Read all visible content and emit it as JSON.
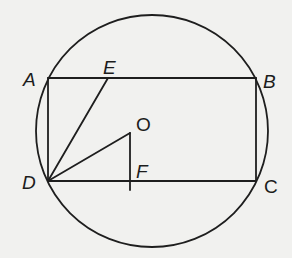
{
  "figure": {
    "type": "geometry-diagram",
    "labels": {
      "A": "A",
      "B": "B",
      "C": "C",
      "D": "D",
      "E": "E",
      "O": "O",
      "F": "F"
    },
    "points": {
      "A": [
        48,
        78
      ],
      "B": [
        256,
        78
      ],
      "C": [
        256,
        181
      ],
      "D": [
        48,
        181
      ],
      "E": [
        108,
        78
      ],
      "O": [
        130,
        133
      ],
      "F": [
        130,
        181
      ]
    },
    "circle": {
      "cx": 152,
      "cy": 131,
      "r": 116
    },
    "segments": [
      "AB",
      "BC",
      "CD",
      "DA",
      "DE",
      "DO",
      "OF"
    ],
    "colors": {
      "ink": "#1e1e1e",
      "paper": "#f1f1ef"
    }
  }
}
